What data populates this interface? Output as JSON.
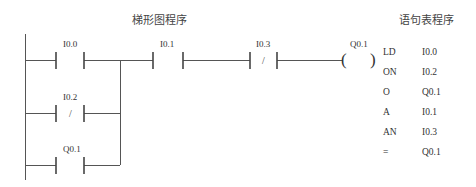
{
  "ladder": {
    "title": "梯形图程序",
    "contacts": [
      {
        "address": "I0.0",
        "type": "NO"
      },
      {
        "address": "I0.1",
        "type": "NO"
      },
      {
        "address": "I0.3",
        "type": "NC",
        "symbol": "/"
      },
      {
        "address": "I0.2",
        "type": "NC",
        "symbol": "/"
      },
      {
        "address": "Q0.1",
        "type": "NO"
      }
    ],
    "coil": {
      "address": "Q0.1",
      "open": "(",
      "close": ")"
    }
  },
  "stl": {
    "title": "语句表程序",
    "rows": [
      {
        "op": "LD",
        "addr": "I0.0"
      },
      {
        "op": "ON",
        "addr": "I0.2"
      },
      {
        "op": "O",
        "addr": "Q0.1"
      },
      {
        "op": "A",
        "addr": "I0.1"
      },
      {
        "op": "AN",
        "addr": "I0.3"
      },
      {
        "op": "=",
        "addr": "Q0.1"
      }
    ]
  }
}
